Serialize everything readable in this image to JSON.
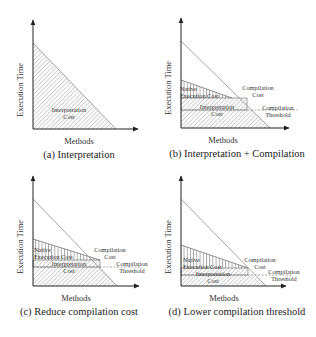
{
  "figure": {
    "axis": {
      "x_label": "Methods",
      "y_label": "Execution Time"
    },
    "labels": {
      "interpretation_cost_line1": "Interpretation",
      "interpretation_cost_line2": "Cost",
      "native_cost_line1": "Native",
      "native_cost_line2": "Execution Cost",
      "compilation_cost_line1": "Compilation",
      "compilation_cost_line2": "Cost",
      "threshold_line1": "Compilation",
      "threshold_line2": "Threshold"
    },
    "panels": [
      {
        "id": "a",
        "caption": "(a) Interpretation"
      },
      {
        "id": "b",
        "caption": "(b) Interpretation + Compilation"
      },
      {
        "id": "c",
        "caption": "(c) Reduce compilation cost"
      },
      {
        "id": "d",
        "caption": "(d) Lower compilation threshold"
      }
    ]
  },
  "colors": {
    "line": "#555555",
    "hatch": "#888888",
    "axis": "#222222",
    "diag": "#999999"
  }
}
